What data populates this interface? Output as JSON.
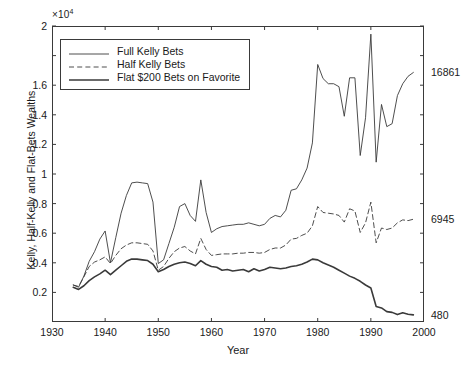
{
  "chart_data": {
    "type": "line",
    "title": "",
    "xlabel": "Year",
    "ylabel": "Kelly, Half-Kelly and Flat-Bets Wealths",
    "y_multiplier": "×10",
    "y_multiplier_exp": "4",
    "xlim": [
      1930,
      2000
    ],
    "ylim": [
      0,
      20000
    ],
    "grid": false,
    "legend_position": "upper left",
    "y_ticks": [
      {
        "value": 0.2,
        "label": "0.2"
      },
      {
        "value": 0.4,
        "label": "0.4"
      },
      {
        "value": 0.6,
        "label": "0.6"
      },
      {
        "value": 0.8,
        "label": "0.8"
      },
      {
        "value": 1.0,
        "label": "1"
      },
      {
        "value": 1.2,
        "label": "1.2"
      },
      {
        "value": 1.4,
        "label": "1.4"
      },
      {
        "value": 1.6,
        "label": "1.6"
      },
      {
        "value": 1.8,
        "label": ""
      },
      {
        "value": 2.0,
        "label": "2"
      }
    ],
    "x_ticks": [
      {
        "value": 1930,
        "label": "1930"
      },
      {
        "value": 1940,
        "label": "1940"
      },
      {
        "value": 1950,
        "label": "1950"
      },
      {
        "value": 1960,
        "label": "1960"
      },
      {
        "value": 1970,
        "label": "1970"
      },
      {
        "value": 1980,
        "label": "1980"
      },
      {
        "value": 1990,
        "label": "1990"
      },
      {
        "value": 2000,
        "label": "2000"
      }
    ],
    "right_annotations": [
      {
        "value": 16861,
        "label": "16861"
      },
      {
        "value": 6945,
        "label": "6945"
      },
      {
        "value": 480,
        "label": "480"
      }
    ],
    "x": [
      1934,
      1935,
      1936,
      1937,
      1938,
      1939,
      1940,
      1941,
      1942,
      1943,
      1944,
      1945,
      1946,
      1947,
      1948,
      1949,
      1950,
      1951,
      1952,
      1953,
      1954,
      1955,
      1956,
      1957,
      1958,
      1959,
      1960,
      1961,
      1962,
      1963,
      1964,
      1965,
      1966,
      1967,
      1968,
      1969,
      1970,
      1971,
      1972,
      1973,
      1974,
      1975,
      1976,
      1977,
      1978,
      1979,
      1980,
      1981,
      1982,
      1983,
      1984,
      1985,
      1986,
      1987,
      1988,
      1989,
      1990,
      1991,
      1992,
      1993,
      1994,
      1995,
      1996,
      1997,
      1998
    ],
    "series": [
      {
        "name": "Full Kelly Bets",
        "style": "solid",
        "width": 0.9,
        "color": "#3a3a3a",
        "values": [
          2500,
          2350,
          3100,
          4100,
          4750,
          5600,
          6150,
          4000,
          5700,
          7350,
          8550,
          9400,
          9450,
          9400,
          9350,
          8100,
          3950,
          4200,
          5300,
          6400,
          7800,
          8000,
          7200,
          6800,
          9600,
          7400,
          6050,
          6300,
          6450,
          6500,
          6550,
          6600,
          6600,
          6700,
          6600,
          6500,
          6600,
          7000,
          7200,
          7100,
          7550,
          8900,
          9000,
          9600,
          10400,
          12100,
          17400,
          16450,
          16100,
          16100,
          15900,
          13900,
          16500,
          16500,
          11250,
          13800,
          19450,
          10800,
          14700,
          13200,
          13400,
          15300,
          16100,
          16600,
          16861
        ]
      },
      {
        "name": "Half Kelly Bets",
        "style": "dashed",
        "width": 0.9,
        "color": "#3a3a3a",
        "values": [
          2500,
          2400,
          3050,
          3750,
          4050,
          4200,
          4400,
          3950,
          4500,
          4950,
          5200,
          5350,
          5350,
          5300,
          5250,
          4800,
          3500,
          3750,
          4300,
          4750,
          5000,
          5100,
          4800,
          4600,
          5650,
          4900,
          4500,
          4550,
          4600,
          4600,
          4600,
          4650,
          4650,
          4700,
          4700,
          4650,
          4700,
          4900,
          5000,
          5000,
          5200,
          5600,
          5650,
          5850,
          6000,
          6500,
          7800,
          7400,
          7350,
          7300,
          7200,
          6750,
          7650,
          7500,
          6050,
          6700,
          8100,
          5350,
          6350,
          6250,
          6350,
          6700,
          6900,
          6850,
          6945
        ]
      },
      {
        "name": "Flat $200 Bets on Favorite",
        "style": "solid",
        "width": 1.6,
        "color": "#3a3a3a",
        "values": [
          2350,
          2200,
          2450,
          2800,
          3050,
          3250,
          3500,
          3200,
          3500,
          3800,
          4100,
          4250,
          4250,
          4200,
          4150,
          3900,
          3400,
          3550,
          3750,
          3900,
          4000,
          4050,
          3950,
          3800,
          4150,
          3900,
          3750,
          3700,
          3500,
          3550,
          3450,
          3500,
          3550,
          3400,
          3600,
          3450,
          3550,
          3700,
          3650,
          3600,
          3650,
          3750,
          3800,
          3900,
          4050,
          4250,
          4200,
          4000,
          3850,
          3700,
          3500,
          3300,
          3100,
          2950,
          2750,
          2500,
          2300,
          1050,
          950,
          700,
          650,
          500,
          620,
          520,
          480
        ]
      }
    ],
    "legend_entries": [
      {
        "label": "Full Kelly Bets",
        "style": "solid",
        "width": 0.9
      },
      {
        "label": "Half Kelly Bets",
        "style": "dashed",
        "width": 0.9
      },
      {
        "label": "Flat $200 Bets on Favorite",
        "style": "solid",
        "width": 1.6
      }
    ]
  }
}
